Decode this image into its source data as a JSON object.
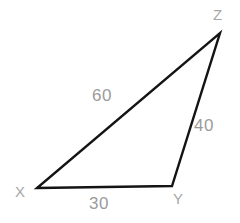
{
  "figure": {
    "type": "triangle-diagram",
    "background_color": "#ffffff",
    "stroke_color": "#141414",
    "stroke_width": 2.4,
    "label_color": "#9b9b9b",
    "vertices": [
      {
        "name": "X",
        "label": "X",
        "x": 37,
        "y": 188
      },
      {
        "name": "Y",
        "label": "Y",
        "x": 172,
        "y": 186
      },
      {
        "name": "Z",
        "label": "Z",
        "x": 220,
        "y": 33
      }
    ],
    "sides": [
      {
        "name": "XY",
        "label": "30",
        "from": "X",
        "to": "Y"
      },
      {
        "name": "YZ",
        "label": "40",
        "from": "Y",
        "to": "Z"
      },
      {
        "name": "XZ",
        "label": "60",
        "from": "X",
        "to": "Z"
      }
    ],
    "vertex_labels": {
      "X": "X",
      "Y": "Y",
      "Z": "Z"
    },
    "side_labels": {
      "XY": "30",
      "YZ": "40",
      "XZ": "60"
    }
  }
}
